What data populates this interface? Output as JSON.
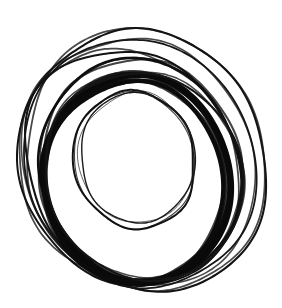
{
  "artwork": {
    "title": "Overlapping Circles Sketch",
    "medium": "ink line drawing",
    "subject": "concentric and offset hand-drawn circles",
    "background_color": "#ffffff",
    "ink_color": "#111111",
    "canvas": {
      "width": 282,
      "height": 308
    },
    "stroke_count": 9,
    "ink_bounds": {
      "left": 17,
      "top": 19,
      "right": 266,
      "bottom": 290
    }
  },
  "strokes": [
    {
      "name": "outermost-ring",
      "cx": 146,
      "cy": 160,
      "rx": 118,
      "ry": 133,
      "rotation": -22,
      "width": 2.1,
      "color": "#141414",
      "note": "largest faint circle, upper-right bias"
    },
    {
      "name": "second-outer-ring",
      "cx": 139,
      "cy": 163,
      "rx": 113,
      "ry": 128,
      "rotation": -28,
      "width": 1.8,
      "color": "#161616",
      "note": "nearly traces outermost, doubling the line"
    },
    {
      "name": "upper-left-ring",
      "cx": 129,
      "cy": 168,
      "rx": 107,
      "ry": 122,
      "rotation": -34,
      "width": 2.0,
      "color": "#131313",
      "note": "shifted left, crosses the outer pair near top-left"
    },
    {
      "name": "mid-ring",
      "cx": 141,
      "cy": 170,
      "rx": 99,
      "ry": 112,
      "rotation": -16,
      "width": 2.6,
      "color": "#101010",
      "note": "medium weight, passes through centre of cluster"
    },
    {
      "name": "heavy-ring-outer",
      "cx": 137,
      "cy": 179,
      "rx": 93,
      "ry": 104,
      "rotation": -12,
      "width": 6.5,
      "color": "#0a0a0a",
      "note": "boldest stroke, very heavy along lower-left arc"
    },
    {
      "name": "heavy-ring-echo",
      "cx": 134,
      "cy": 182,
      "rx": 90,
      "ry": 101,
      "rotation": -8,
      "width": 4.2,
      "color": "#0c0c0c",
      "note": "second pass over the bold ring thickening bottom"
    },
    {
      "name": "lower-arc-ring",
      "cx": 144,
      "cy": 176,
      "rx": 96,
      "ry": 107,
      "rotation": -30,
      "width": 2.2,
      "color": "#151515",
      "note": "thin ring skimming the bottom edge"
    },
    {
      "name": "inner-ring",
      "cx": 134,
      "cy": 160,
      "rx": 60,
      "ry": 69,
      "rotation": -14,
      "width": 2.0,
      "color": "#121212",
      "note": "small thin circle enclosing the empty centre"
    },
    {
      "name": "inner-ring-echo",
      "cx": 137,
      "cy": 158,
      "rx": 57,
      "ry": 66,
      "rotation": -5,
      "width": 1.4,
      "color": "#1a1a1a",
      "note": "faint retrace of the inner circle"
    }
  ]
}
